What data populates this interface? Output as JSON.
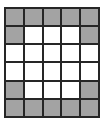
{
  "figure": {
    "name": "grid-pattern",
    "type": "binary-cell-grid",
    "rows": 6,
    "columns": 5,
    "colors": {
      "filled": "#a3a3a3",
      "empty": "#ffffff",
      "gridline": "#262626",
      "background": "#ffffff"
    },
    "legend": {
      "filled_label": "filled",
      "empty_label": "empty"
    },
    "cells": [
      [
        "filled",
        "filled",
        "filled",
        "filled",
        "filled"
      ],
      [
        "filled",
        "empty",
        "empty",
        "empty",
        "filled"
      ],
      [
        "empty",
        "empty",
        "empty",
        "empty",
        "empty"
      ],
      [
        "empty",
        "empty",
        "empty",
        "empty",
        "empty"
      ],
      [
        "filled",
        "empty",
        "empty",
        "empty",
        "filled"
      ],
      [
        "filled",
        "filled",
        "filled",
        "filled",
        "filled"
      ]
    ],
    "filled_count": 16,
    "empty_count": 14,
    "total_count": 30
  }
}
